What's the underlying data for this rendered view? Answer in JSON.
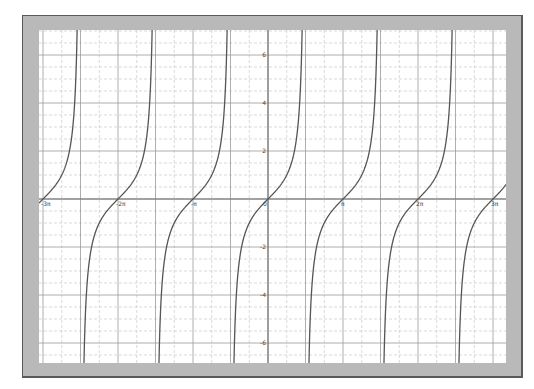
{
  "chart_data": {
    "type": "line",
    "title": "",
    "function": "y = tan(x)",
    "xlabel": "",
    "ylabel": "",
    "xlim_radians": [
      -9.58,
      9.93
    ],
    "ylim": [
      -6.85,
      7.05
    ],
    "x_tick_labels": [
      "-3π",
      "-2π",
      "-π",
      "0",
      "π",
      "2π",
      "3π"
    ],
    "x_tick_values": [
      -9.4248,
      -6.2832,
      -3.1416,
      0,
      3.1416,
      6.2832,
      9.4248
    ],
    "y_tick_labels": [
      "6",
      "4",
      "2",
      "-2",
      "-4",
      "-6"
    ],
    "y_tick_values": [
      6,
      4,
      2,
      -2,
      -4,
      -6
    ],
    "grid": {
      "major_x_step": "π/2",
      "minor_x_step": "π/4",
      "major_y_step": 2,
      "minor_y_step": 0.5
    },
    "asymptotes": [
      "-5π/2",
      "-3π/2",
      "-π/2",
      "π/2",
      "3π/2",
      "5π/2"
    ],
    "series": [
      {
        "name": "tan(x)",
        "color": "#555555"
      }
    ],
    "legend": "none"
  },
  "colors": {
    "frame": "#b9b9b9",
    "frame_border": "#5a5a5a",
    "plot_bg": "#ffffff",
    "grid_major": "#9a9a9a",
    "grid_minor": "#c8c8c8",
    "axis": "#6e6e6e",
    "curve": "#555555"
  }
}
